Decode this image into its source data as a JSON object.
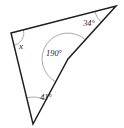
{
  "figure": {
    "type": "geometry-diagram",
    "background_color": "#ffffff",
    "stroke_color": "#1d1d1d",
    "arc_color": "#9a9a9a",
    "label_color": "#222222",
    "canvas": {
      "width": 124,
      "height": 128
    },
    "shape": {
      "name": "concave-quadrilateral",
      "closed": true,
      "vertices": [
        {
          "id": "A",
          "name": "left-vertex",
          "x": 11,
          "y": 33
        },
        {
          "id": "B",
          "name": "top-right-vertex",
          "x": 116,
          "y": 6
        },
        {
          "id": "C",
          "name": "reflex-vertex",
          "x": 68,
          "y": 59
        },
        {
          "id": "D",
          "name": "bottom-vertex",
          "x": 33,
          "y": 124
        }
      ],
      "edges": [
        {
          "from": "A",
          "to": "B",
          "name": "top-edge"
        },
        {
          "from": "B",
          "to": "C",
          "name": "right-upper-edge"
        },
        {
          "from": "C",
          "to": "D",
          "name": "right-lower-edge"
        },
        {
          "from": "D",
          "to": "A",
          "name": "left-edge"
        }
      ]
    },
    "angles": [
      {
        "id": "angle-x",
        "name": "angle-label-x",
        "vertex": "A",
        "label": "x",
        "is_unknown": true,
        "arc_radius": 13,
        "label_x": 21,
        "label_y": 47,
        "font_size": 9
      },
      {
        "id": "angle-34",
        "name": "angle-label-34",
        "vertex": "B",
        "label": "34°",
        "value": 34,
        "unit": "degrees",
        "arc_radius": 22,
        "label_x": 89,
        "label_y": 24,
        "font_size": 8.4
      },
      {
        "id": "angle-190",
        "name": "angle-label-190",
        "vertex": "C",
        "label": "190°",
        "value": 190,
        "unit": "degrees",
        "reflex": true,
        "arc_radius": 26,
        "label_x": 54,
        "label_y": 54,
        "font_size": 8.4
      },
      {
        "id": "angle-41",
        "name": "angle-label-41",
        "vertex": "D",
        "label": "41°",
        "value": 41,
        "unit": "degrees",
        "arc_radius": 27,
        "label_x": 46,
        "label_y": 98,
        "font_size": 8.4
      }
    ]
  }
}
